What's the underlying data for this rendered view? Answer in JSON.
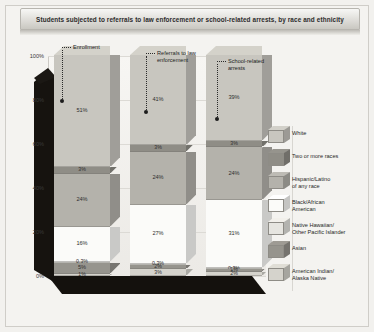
{
  "chart": {
    "title": "Students subjected to referrals to law enforcement or school-related arrests, by race and ethnicity"
  },
  "callouts": [
    {
      "id": "enrollment",
      "label": "Enrollment"
    },
    {
      "id": "referrals",
      "line1": "Referrals to law",
      "line2": "enforcement"
    },
    {
      "id": "arrests",
      "line1": "School-related",
      "line2": "arrests"
    }
  ],
  "axis": {
    "ticks": [
      "100%",
      "80%",
      "60%",
      "40%",
      "20%",
      "0%"
    ]
  },
  "legend": [
    {
      "label": "White",
      "color": "#c8c6bf"
    },
    {
      "label": "Two or more races",
      "color": "#8f8d86"
    },
    {
      "label": "Hispanic/Latino of any race",
      "line1": "Hispanic/Latino",
      "line2": "of any race",
      "color": "#b4b2ab"
    },
    {
      "label": "Black/African American",
      "line1": "Black/African",
      "line2": "American",
      "color": "#fbfbf9"
    },
    {
      "label": "Native Hawaiian/Other Pacific Islander",
      "line1": "Native Hawaiian/",
      "line2": "Other Pacific Islander",
      "color": "#e6e5e0"
    },
    {
      "label": "Asian",
      "color": "#96948d"
    },
    {
      "label": "American Indian/Alaska Native",
      "line1": "American Indian/",
      "line2": "Alaska Native",
      "color": "#d5d3cc"
    }
  ],
  "chart_data": {
    "type": "bar",
    "subtype": "stacked-column-3d",
    "title": "Students subjected to referrals to law enforcement or school-related arrests, by race and ethnicity",
    "xlabel": "",
    "ylabel": "",
    "ylim": [
      0,
      100
    ],
    "ytick_labels": [
      "0%",
      "20%",
      "40%",
      "60%",
      "80%",
      "100%"
    ],
    "grid": true,
    "legend_position": "right",
    "categories": [
      "Enrollment",
      "Referrals to law enforcement",
      "School-related arrests"
    ],
    "series": [
      {
        "name": "White",
        "color": "#c8c6bf",
        "values": [
          51,
          41,
          39
        ],
        "labels": [
          "51%",
          "41%",
          "39%"
        ]
      },
      {
        "name": "Two or more races",
        "color": "#8f8d86",
        "values": [
          3,
          3,
          3
        ],
        "labels": [
          "3%",
          "3%",
          "3%"
        ]
      },
      {
        "name": "Hispanic/Latino of any race",
        "color": "#b4b2ab",
        "values": [
          24,
          24,
          24
        ],
        "labels": [
          "24%",
          "24%",
          "24%"
        ]
      },
      {
        "name": "Black/African American",
        "color": "#fbfbf9",
        "values": [
          16,
          27,
          31
        ],
        "labels": [
          "16%",
          "27%",
          "31%"
        ]
      },
      {
        "name": "Native Hawaiian/Other Pacific Islander",
        "color": "#e6e5e0",
        "values": [
          0.3,
          0.3,
          0.3
        ],
        "labels": [
          "0.3%",
          "0.3%",
          "0.3%"
        ]
      },
      {
        "name": "Asian",
        "color": "#96948d",
        "values": [
          5,
          2,
          1
        ],
        "labels": [
          "5%",
          "2%",
          "1%"
        ]
      },
      {
        "name": "American Indian/Alaska Native",
        "color": "#d5d3cc",
        "values": [
          1,
          3,
          2
        ],
        "labels": [
          "1%",
          "3%",
          "2%"
        ]
      }
    ]
  }
}
